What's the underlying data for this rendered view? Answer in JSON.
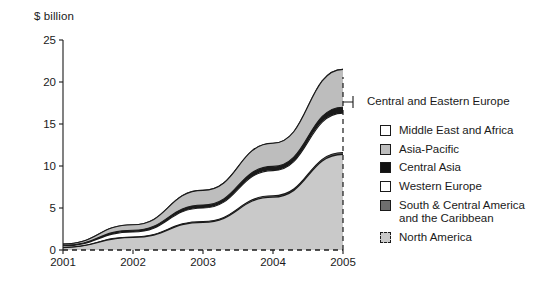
{
  "chart_data": {
    "type": "area",
    "title": "",
    "subtitle": "",
    "ylabel": "$ billion",
    "xlabel": "",
    "categories": [
      "2001",
      "2002",
      "2003",
      "2004",
      "2005"
    ],
    "x": [
      2001,
      2002,
      2003,
      2004,
      2005
    ],
    "ylim": [
      0,
      25
    ],
    "yticks": [
      0,
      5,
      10,
      15,
      20,
      25
    ],
    "grid": false,
    "stacked": true,
    "legend_position": "right",
    "annotations": [
      {
        "text": "Central and Eastern Europe",
        "points_to": "top band at 2005"
      }
    ],
    "series": [
      {
        "name": "North America",
        "color": "#c9c9c9",
        "border": "dashed",
        "values": [
          0.3,
          1.5,
          3.3,
          6.3,
          11.4
        ]
      },
      {
        "name": "South & Central America\nand the Caribbean",
        "color": "#6e6e6e",
        "values": [
          0.0,
          0.05,
          0.1,
          0.15,
          0.2
        ]
      },
      {
        "name": "Western Europe",
        "color": "#ffffff",
        "values": [
          0.2,
          0.6,
          1.6,
          3.0,
          4.7
        ]
      },
      {
        "name": "Central Asia",
        "color": "#1a1a1a",
        "values": [
          0.05,
          0.2,
          0.35,
          0.5,
          0.7
        ]
      },
      {
        "name": "Asia-Pacific",
        "color": "#bdbdbd",
        "values": [
          0.15,
          0.65,
          1.75,
          2.75,
          4.5
        ]
      },
      {
        "name": "Middle East and Africa",
        "color": "#ffffff",
        "values": [
          0.0,
          0.0,
          0.0,
          0.0,
          0.0
        ]
      }
    ],
    "totals": [
      0.7,
      3.0,
      7.1,
      12.7,
      21.5
    ]
  },
  "axis": {
    "y_title": "$ billion",
    "yticks": [
      "25",
      "20",
      "15",
      "10",
      "5",
      "0"
    ],
    "xticks": [
      "2001",
      "2002",
      "2003",
      "2004",
      "2005"
    ]
  },
  "callout": {
    "label": "Central and Eastern Europe"
  },
  "legend": {
    "items": [
      {
        "label": "Middle East and Africa",
        "swatch": "white-solid"
      },
      {
        "label": "Asia-Pacific",
        "swatch": "light-grey-solid"
      },
      {
        "label": "Central Asia",
        "swatch": "black-solid"
      },
      {
        "label": "Western Europe",
        "swatch": "white-solid"
      },
      {
        "label": "South & Central America\nand the Caribbean",
        "swatch": "dark-grey-solid"
      },
      {
        "label": "North America",
        "swatch": "light-grey-dashed"
      }
    ]
  },
  "colors": {
    "ink": "#1a1a1a",
    "light_grey": "#c9c9c9",
    "mid_grey": "#bdbdbd",
    "dark_grey": "#6e6e6e",
    "black": "#111111",
    "white": "#ffffff"
  }
}
